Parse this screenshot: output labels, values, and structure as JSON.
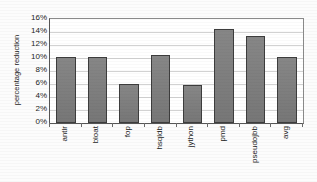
{
  "chart_data": {
    "type": "bar",
    "title": "",
    "xlabel": "",
    "ylabel": "percentage reduction",
    "categories": [
      "antlr",
      "bloat",
      "fop",
      "hsqldb",
      "jython",
      "pmd",
      "pseudojbb",
      "avg"
    ],
    "values": [
      10.2,
      10.1,
      6.0,
      10.5,
      5.8,
      14.5,
      13.4,
      10.2
    ],
    "ylim": [
      0,
      16
    ],
    "ytick_step": 2,
    "ytick_labels": [
      "0%",
      "2%",
      "4%",
      "6%",
      "8%",
      "10%",
      "12%",
      "14%",
      "16%"
    ],
    "ytick_values": [
      0,
      2,
      4,
      6,
      8,
      10,
      12,
      14,
      16
    ],
    "grid": "horizontal",
    "legend": "none",
    "bar_color": "#7d7d7d",
    "bar_edge_color": "#3d3d3d",
    "grid_color": "#d2d2d2",
    "axis_color": "#555555",
    "background_color": "#ffffff",
    "xtick_label_rotation": 90
  }
}
